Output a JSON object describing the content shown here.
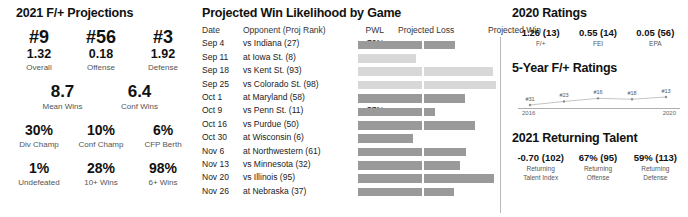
{
  "left": {
    "title": "2021 F/+ Projections",
    "rank_row": [
      {
        "rank": "#9",
        "value": "1.32",
        "label": "Overall"
      },
      {
        "rank": "#56",
        "value": "0.18",
        "label": "Offense"
      },
      {
        "rank": "#3",
        "value": "1.92",
        "label": "Defense"
      }
    ],
    "wins_row": [
      {
        "value": "8.7",
        "label": "Mean Wins"
      },
      {
        "value": "6.4",
        "label": "Conf Wins"
      }
    ],
    "pct_row_1": [
      {
        "value": "30%",
        "label": "Div Champ"
      },
      {
        "value": "10%",
        "label": "Conf Champ"
      },
      {
        "value": "6%",
        "label": "CFP Berth"
      }
    ],
    "pct_row_2": [
      {
        "value": "1%",
        "label": "Undefeated"
      },
      {
        "value": "28%",
        "label": "10+ Wins"
      },
      {
        "value": "98%",
        "label": "6+ Wins"
      }
    ]
  },
  "middle": {
    "title": "Projected Win Likelihood by Game",
    "columns": {
      "date": "Date",
      "opponent": "Opponent (Proj Rank)",
      "pwl": "PWL",
      "proj_loss": "Projected Loss",
      "proj_win": "Projected Win"
    }
  },
  "right": {
    "ratings_title": "2020 Ratings",
    "ratings": [
      {
        "value": "1.26 (13)",
        "label": "F/+"
      },
      {
        "value": "0.55 (14)",
        "label": "FEI"
      },
      {
        "value": "0.05 (56)",
        "label": "EPA"
      }
    ],
    "spark_title": "5-Year F/+ Ratings",
    "spark_start_year": "2016",
    "spark_end_year": "2020",
    "talent_title": "2021 Returning Talent",
    "talent": [
      {
        "value": "-0.70 (102)",
        "label1": "Returning",
        "label2": "Talent Index"
      },
      {
        "value": "67% (95)",
        "label1": "Returning",
        "label2": "Offense"
      },
      {
        "value": "59% (113)",
        "label1": "Returning",
        "label2": "Defense"
      }
    ]
  },
  "colors": {
    "bar_dark": "#9a9a9a",
    "bar_light": "#d8d8d8",
    "axis": "#b9b9b9",
    "text": "#1a1a1a",
    "muted": "#555555"
  },
  "chart_data": {
    "type": "bar",
    "title": "Projected Win Likelihood by Game",
    "xlabel": "",
    "ylabel": "",
    "legend": [
      "Projected Loss",
      "Projected Win"
    ],
    "legend_position": "top",
    "grid": false,
    "xlim": [
      0,
      100
    ],
    "categories": [
      "Sep 4 vs Indiana (27)",
      "Sep 11 at Iowa St. (8)",
      "Sep 18 vs Kent St. (93)",
      "Sep 25 vs Colorado St. (98)",
      "Oct 1 at Maryland (58)",
      "Oct 9 vs Penn St. (11)",
      "Oct 16 vs Purdue (50)",
      "Oct 30 at Wisconsin (6)",
      "Nov 6 at Northwestern (61)",
      "Nov 13 vs Minnesota (32)",
      "Nov 20 vs Illinois (95)",
      "Nov 26 at Nebraska (37)"
    ],
    "rows": [
      {
        "date": "Sep 4",
        "opponent": "vs Indiana (27)",
        "pwl": "70%",
        "pwl_value": 70,
        "tone": "dark"
      },
      {
        "date": "Sep 11",
        "opponent": "at Iowa St. (8)",
        "pwl": "42%",
        "pwl_value": 42,
        "tone": "light"
      },
      {
        "date": "Sep 18",
        "opponent": "vs Kent St. (93)",
        "pwl": "94%",
        "pwl_value": 94,
        "tone": "light"
      },
      {
        "date": "Sep 25",
        "opponent": "vs Colorado St. (98)",
        "pwl": "96%",
        "pwl_value": 96,
        "tone": "light"
      },
      {
        "date": "Oct 1",
        "opponent": "at Maryland (58)",
        "pwl": "76%",
        "pwl_value": 76,
        "tone": "dark"
      },
      {
        "date": "Oct 9",
        "opponent": "vs Penn St. (11)",
        "pwl": "57%",
        "pwl_value": 57,
        "tone": "dark"
      },
      {
        "date": "Oct 16",
        "opponent": "vs Purdue (50)",
        "pwl": "83%",
        "pwl_value": 83,
        "tone": "dark"
      },
      {
        "date": "Oct 30",
        "opponent": "at Wisconsin (6)",
        "pwl": "37%",
        "pwl_value": 37,
        "tone": "dark"
      },
      {
        "date": "Nov 6",
        "opponent": "at Northwestern (61)",
        "pwl": "77%",
        "pwl_value": 77,
        "tone": "dark"
      },
      {
        "date": "Nov 13",
        "opponent": "vs Minnesota (32)",
        "pwl": "73%",
        "pwl_value": 73,
        "tone": "dark"
      },
      {
        "date": "Nov 20",
        "opponent": "vs Illinois (95)",
        "pwl": "95%",
        "pwl_value": 95,
        "tone": "dark"
      },
      {
        "date": "Nov 26",
        "opponent": "at Nebraska (37)",
        "pwl": "69%",
        "pwl_value": 69,
        "tone": "dark"
      }
    ]
  },
  "spark_data": {
    "type": "line",
    "title": "5-Year F/+ Ratings",
    "x": [
      "2016",
      "2017",
      "2018",
      "2019",
      "2020"
    ],
    "point_labels": [
      "#31",
      "#23",
      "#16",
      "#18",
      "#13"
    ],
    "values": [
      31,
      23,
      16,
      18,
      13
    ],
    "ylabel": "",
    "xlabel": ""
  }
}
